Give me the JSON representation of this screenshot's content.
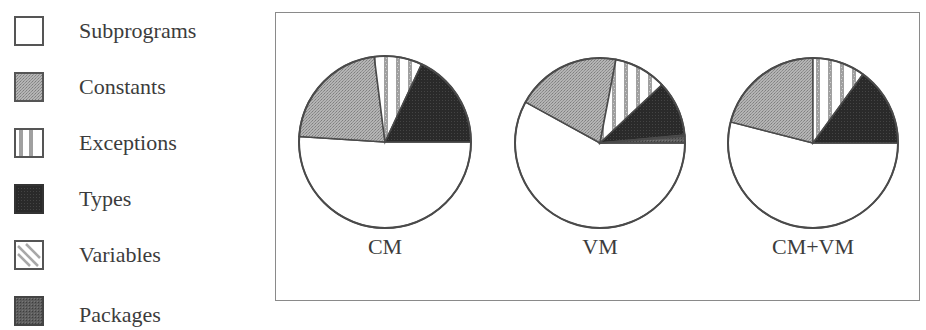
{
  "chart_data": {
    "type": "pie",
    "title": "",
    "legend": {
      "position": "left",
      "entries": [
        {
          "name": "Subprograms",
          "pattern": "white"
        },
        {
          "name": "Constants",
          "pattern": "light-gray-stipple"
        },
        {
          "name": "Exceptions",
          "pattern": "vertical-stripes"
        },
        {
          "name": "Types",
          "pattern": "black"
        },
        {
          "name": "Variables",
          "pattern": "diagonal-stripes"
        },
        {
          "name": "Packages",
          "pattern": "dark-gray-stipple"
        }
      ]
    },
    "categories": [
      "Subprograms",
      "Constants",
      "Exceptions",
      "Types",
      "Variables",
      "Packages"
    ],
    "pies": [
      {
        "label": "CM",
        "values": [
          51,
          22,
          9,
          18,
          0,
          0
        ]
      },
      {
        "label": "VM",
        "values": [
          58,
          20,
          10,
          10.5,
          0.3,
          1.2
        ]
      },
      {
        "label": "CM+VM",
        "values": [
          54,
          21,
          10,
          15,
          0,
          0
        ]
      }
    ],
    "units": "percent (estimated from slice angles)"
  },
  "legend": {
    "items": [
      {
        "label": "Subprograms"
      },
      {
        "label": "Constants"
      },
      {
        "label": "Exceptions"
      },
      {
        "label": "Types"
      },
      {
        "label": "Variables"
      },
      {
        "label": "Packages"
      }
    ]
  },
  "pies": {
    "labels": [
      "CM",
      "VM",
      "CM+VM"
    ]
  },
  "colors": {
    "subprograms": "#ffffff",
    "constants": "#a9a9a9",
    "exceptions_stripe": "#9a9a9a",
    "types": "#2e2e2e",
    "variables_stripe": "#9a9a9a",
    "packages": "#5a5a5a",
    "outline": "#4a4a4a"
  }
}
